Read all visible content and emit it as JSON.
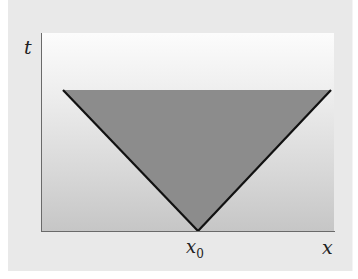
{
  "diagram": {
    "type": "light-cone",
    "axes": {
      "vertical_label": "t",
      "horizontal_label": "x"
    },
    "markers": {
      "apex_label": "x",
      "apex_subscript": "0"
    },
    "colors": {
      "frame_background": "#e9e9e9",
      "plot_gradient_top": "#fcfcfc",
      "plot_gradient_bottom": "#c6c6c6",
      "cone_fill": "#8c8c8c",
      "cone_edge": "#111111",
      "axis": "#6a6a6a"
    },
    "cone": {
      "apex": [
        198,
        231
      ],
      "top_left": [
        63,
        90
      ],
      "top_right": [
        331,
        90
      ]
    }
  }
}
